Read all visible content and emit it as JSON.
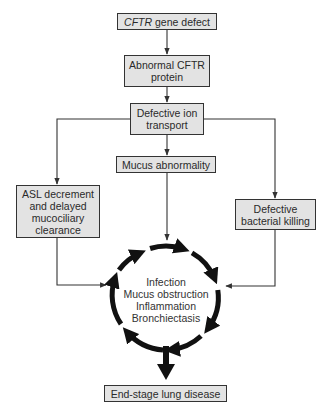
{
  "nodes": {
    "gene_defect": {
      "italic": "CFTR",
      "rest": " gene defect"
    },
    "abnormal_protein": {
      "line1": "Abnormal CFTR",
      "line2": "protein"
    },
    "ion_transport": {
      "line1": "Defective ion",
      "line2": "transport"
    },
    "mucus": {
      "label": "Mucus abnormality"
    },
    "asl": {
      "line1": "ASL decrement",
      "line2": "and delayed",
      "line3": "mucociliary",
      "line4": "clearance"
    },
    "bacterial": {
      "line1": "Defective",
      "line2": "bacterial killing"
    },
    "end_stage": {
      "label": "End-stage lung disease"
    }
  },
  "cycle": {
    "items": [
      "Infection",
      "Mucus obstruction",
      "Inflammation",
      "Bronchiectasis"
    ]
  },
  "colors": {
    "box_fill": "#e3e3e3",
    "stroke": "#333333",
    "cycle": "#111111"
  }
}
